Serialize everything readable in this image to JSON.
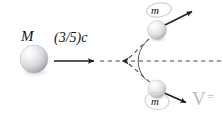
{
  "figure": {
    "type": "physics-diagram",
    "background_color": "#ffffff",
    "ink_color": "#222222"
  },
  "labels": {
    "big_mass": "M",
    "speed": "(3/5)c",
    "small_mass_top": "m",
    "small_mass_bottom": "m",
    "velocity_symbol": "V",
    "velocity_equals": "="
  },
  "bodies": [
    {
      "id": "big-sphere",
      "label": "M",
      "cx": 34,
      "cy": 59,
      "r": 14,
      "fill_light": "#fdfdfd",
      "fill_dark": "#9a9aa0"
    },
    {
      "id": "top-sphere",
      "label": "m",
      "cx": 157,
      "cy": 30,
      "r": 9.5,
      "fill_light": "#fdfdfd",
      "fill_dark": "#a6a6ac"
    },
    {
      "id": "bottom-sphere",
      "label": "m",
      "cx": 157,
      "cy": 89,
      "r": 9,
      "fill_light": "#fdfdfd",
      "fill_dark": "#a6a6ac"
    }
  ],
  "vectors": [
    {
      "id": "incoming-velocity-arrow",
      "name": "incoming-velocity-arrow",
      "label": "(3/5)c",
      "style": "solid",
      "from": [
        54,
        61
      ],
      "to": [
        98,
        61
      ]
    },
    {
      "id": "top-velocity-arrow",
      "name": "top-velocity-arrow",
      "style": "solid",
      "from": [
        162,
        26
      ],
      "to": [
        196,
        9
      ]
    },
    {
      "id": "bottom-velocity-arrow",
      "name": "bottom-velocity-arrow",
      "label": "V =",
      "style": "solid",
      "from": [
        163,
        92
      ],
      "to": [
        190,
        104
      ]
    }
  ],
  "construction_lines": [
    {
      "id": "axis-dashed-left",
      "name": "axis-dashed-left",
      "style": "dashed",
      "from": [
        100,
        61
      ],
      "to": [
        126,
        61
      ]
    },
    {
      "id": "axis-dashed-right",
      "name": "axis-dashed-right",
      "style": "dashed",
      "from": [
        126,
        61
      ],
      "to": [
        221,
        61
      ]
    },
    {
      "id": "branch-dashed-upper",
      "name": "branch-dashed-upper",
      "style": "dashed",
      "from": [
        126,
        61
      ],
      "to": [
        152,
        36
      ]
    },
    {
      "id": "branch-dashed-lower",
      "name": "branch-dashed-lower",
      "style": "dashed",
      "from": [
        126,
        61
      ],
      "to": [
        152,
        84
      ]
    }
  ],
  "vertex": {
    "id": "decay-vertex",
    "x": 126,
    "y": 61,
    "has_left_arrowhead": true
  },
  "angle_arc": {
    "id": "opening-angle-arc",
    "center": [
      126,
      61
    ],
    "radius": 27,
    "from_deg": -44,
    "to_deg": 41
  }
}
